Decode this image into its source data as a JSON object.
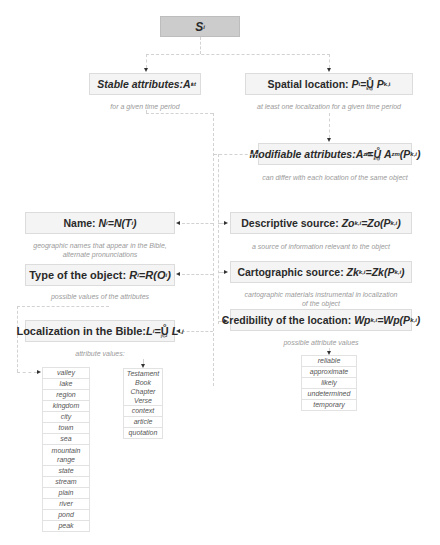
{
  "root": {
    "label": "S",
    "sub": "i"
  },
  "stable": {
    "label": "Stable attributes: ",
    "symbol": "A",
    "sup": "st",
    "sub": "i",
    "note": "for a given time period"
  },
  "spatial": {
    "label": "Spatial location: ",
    "formula_lhs": "P",
    "lhs_sub": "i",
    "op": "=",
    "union": "Ů",
    "union_idx": "k∈I",
    "formula_rhs": "P",
    "rhs_sub": "k,i",
    "note": "at least one localization for a given time period"
  },
  "modifiable": {
    "label": "Modifiable attributes: ",
    "lhs": "A",
    "lhs_sup": "zm",
    "lhs_sub": "i",
    "op": "=",
    "union": "Ů",
    "union_idx": "k∈I",
    "rhs": "A",
    "rhs_sup": "zm",
    "rhs_arg": "(P",
    "rhs_arg_sub": "k,i",
    "rhs_close": ")",
    "note": "can differ with each location of the same object"
  },
  "name": {
    "label": "Name: ",
    "formula": "N",
    "sub": "i",
    "rest": "=N(T",
    "rest_sub": "i",
    "close": ")",
    "note_lines": [
      "geographic names that appear in the Bible,",
      "alternate pronunciations"
    ]
  },
  "type": {
    "label": "Type of the object: ",
    "formula": "R",
    "sub": "i",
    "rest": "=R(O",
    "rest_sub": "i",
    "close": ")",
    "note": "possible values of the attributes"
  },
  "localization": {
    "label": "Localization in the Bible: ",
    "formula": "L",
    "sub": "i",
    "op": "=",
    "union": "Ů",
    "union_idx": "j∈J",
    "rhs": "L",
    "rhs_sub": "i,j",
    "note": "attribute values:"
  },
  "descriptive": {
    "label": "Descriptive source: ",
    "formula": "Zo",
    "sub": "k,i",
    "rest": "=Zo(P",
    "rest_sub": "k,i",
    "close": ")",
    "note": "a source of information relevant to the object"
  },
  "cartographic": {
    "label": "Cartographic source: ",
    "formula": "Zk",
    "sub": "k,i",
    "rest": "=Zk(P",
    "rest_sub": "k,i",
    "close": ")",
    "note_lines": [
      "cartographic materials instrumental in localization",
      "of the object"
    ]
  },
  "credibility": {
    "label": "Credibility of the location: ",
    "formula": "Wp",
    "sub": "k,i",
    "rest": "=Wp(P",
    "rest_sub": "k,i",
    "close": ")",
    "note": "possible attribute values",
    "values": [
      "reliable",
      "approximate",
      "likely",
      "undetermined",
      "temporary"
    ]
  },
  "type_values": [
    "valley",
    "lake",
    "region",
    "kingdom",
    "city",
    "town",
    "sea",
    "mountain range",
    "state",
    "stream",
    "plain",
    "river",
    "pond",
    "peak"
  ],
  "bible_values": {
    "group": [
      "Testament",
      "Book",
      "Chapter",
      "Verse"
    ],
    "others": [
      "context",
      "article",
      "quotation"
    ]
  }
}
